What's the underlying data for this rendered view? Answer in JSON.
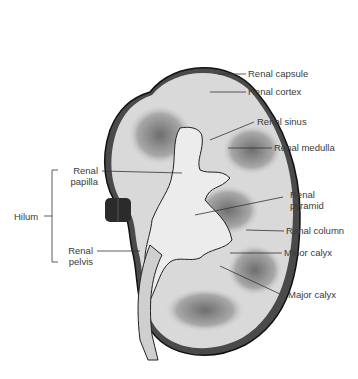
{
  "diagram": {
    "colors": {
      "background": "#ffffff",
      "cortex": "#d9d9d9",
      "medulla": "#8c8c8c",
      "outline": "#1a1a1a",
      "label_text": "#3a3a3a",
      "leader_line": "#333333"
    },
    "labels_right": [
      {
        "id": "renal-capsule",
        "text": "Renal capsule"
      },
      {
        "id": "renal-cortex",
        "text": "Renal cortex"
      },
      {
        "id": "renal-sinus",
        "text": "Renal sinus"
      },
      {
        "id": "renal-medulla",
        "text": "Renal medulla"
      },
      {
        "id": "renal-pyramid",
        "line1": "Renal",
        "line2": "pyramid"
      },
      {
        "id": "renal-column",
        "text": "Renal column"
      },
      {
        "id": "minor-calyx",
        "text": "Minor calyx"
      },
      {
        "id": "major-calyx",
        "text": "Major calyx"
      }
    ],
    "labels_left": [
      {
        "id": "renal-papilla",
        "line1": "Renal",
        "line2": "papilla"
      },
      {
        "id": "hilum",
        "text": "Hilum"
      },
      {
        "id": "renal-pelvis",
        "line1": "Renal",
        "line2": "pelvis"
      }
    ]
  }
}
